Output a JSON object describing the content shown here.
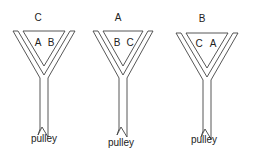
{
  "figures": [
    {
      "id": "fig1",
      "top_label": "C",
      "inner_left_label": "A",
      "inner_right_label": "B",
      "bottom_label": "pulley",
      "cx": 44,
      "top_y": 31,
      "outer_half_width": 31,
      "top_label_pos": [
        38,
        21
      ],
      "inner_labels_pos": [
        [
          38,
          46
        ],
        [
          51,
          46
        ]
      ],
      "pulley_pos": [
        44,
        142
      ]
    },
    {
      "id": "fig2",
      "top_label": "A",
      "inner_left_label": "B",
      "inner_right_label": "C",
      "bottom_label": "pulley",
      "cx": 123,
      "top_y": 31,
      "outer_half_width": 30,
      "top_label_pos": [
        118,
        21
      ],
      "inner_labels_pos": [
        [
          117,
          46
        ],
        [
          130,
          46
        ]
      ],
      "pulley_pos": [
        121,
        146
      ]
    },
    {
      "id": "fig3",
      "top_label": "B",
      "inner_left_label": "C",
      "inner_right_label": "A",
      "bottom_label": "pulley",
      "cx": 207,
      "top_y": 33,
      "outer_half_width": 31,
      "top_label_pos": [
        202,
        22
      ],
      "inner_labels_pos": [
        [
          199,
          47
        ],
        [
          213,
          47
        ]
      ],
      "pulley_pos": [
        204,
        143
      ]
    }
  ],
  "colors": {
    "line": "#444444",
    "text": "#222222",
    "background": "#ffffff"
  }
}
